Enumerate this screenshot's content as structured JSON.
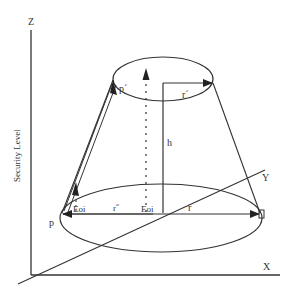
{
  "diagram": {
    "axes": {
      "z_label": "Z",
      "x_label": "X",
      "y_label": "Y",
      "vertical_axis_title": "Security Level"
    },
    "points": {
      "p": "p",
      "p_prime": "p´"
    },
    "dimensions": {
      "height": "h",
      "base_radius": "r",
      "top_radius": "r´",
      "inner_radius": "r˝"
    },
    "markers": {
      "eoi_left": "Eoi",
      "eoi_center": "Eoi"
    },
    "colors": {
      "line": "#333333",
      "background": "#ffffff"
    }
  }
}
